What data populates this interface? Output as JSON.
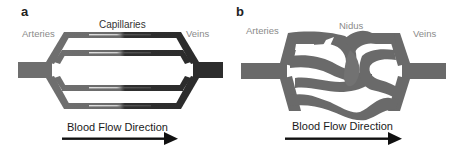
{
  "panels": [
    {
      "letter": "a",
      "title": "Normal vasculature",
      "labels": {
        "arteries": "Arteries",
        "capillaries": "Capillaries",
        "veins": "Veins"
      },
      "flow_label": "Blood Flow Direction"
    },
    {
      "letter": "b",
      "title": "Arteriovenous malformation",
      "labels": {
        "arteries": "Arteries",
        "nidus": "Nidus",
        "veins": "Veins"
      },
      "flow_label": "Blood Flow Direction"
    }
  ],
  "colors": {
    "artery": "#6e6e6e",
    "vein": "#2e2e2e",
    "nidus": "#6a6a6a",
    "highlight": "#d8d8d8",
    "label_gray": "#8a8a8a",
    "text_dark": "#1a1a1a",
    "background": "#ffffff"
  }
}
